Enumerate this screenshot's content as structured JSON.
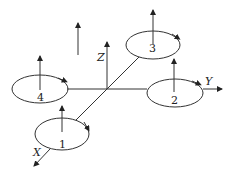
{
  "diagram": {
    "axes": {
      "x_label": "X",
      "y_label": "Y",
      "z_label": "Z"
    },
    "rotors": [
      {
        "id": "rotor-1",
        "label": "1"
      },
      {
        "id": "rotor-2",
        "label": "2"
      },
      {
        "id": "rotor-3",
        "label": "3"
      },
      {
        "id": "rotor-4",
        "label": "4"
      }
    ],
    "colors": {
      "stroke": "#333333",
      "background": "#ffffff"
    }
  }
}
